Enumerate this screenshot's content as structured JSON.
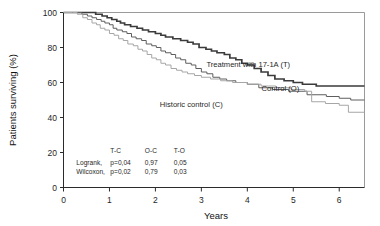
{
  "chart_data": {
    "type": "line",
    "title": "",
    "xlabel": "Years",
    "ylabel": "Patients surviving (%)",
    "xlim": [
      0,
      6.55
    ],
    "ylim": [
      0,
      100
    ],
    "xticks": [
      "0",
      "1",
      "2",
      "3",
      "4",
      "5",
      "6"
    ],
    "xtick_values": [
      0,
      1,
      2,
      3,
      4,
      5,
      6
    ],
    "yticks": [
      "0",
      "20",
      "40",
      "60",
      "80",
      "100"
    ],
    "ytick_values": [
      0,
      20,
      40,
      60,
      80,
      100
    ],
    "grid": false,
    "legend_position": "inline-annotations",
    "series": [
      {
        "name": "Treatment with 17-1A (T)",
        "key": "T",
        "color": "#3b3b3b",
        "label_x": 4.02,
        "label_y": 69,
        "points": [
          [
            0.0,
            100
          ],
          [
            0.62,
            100
          ],
          [
            0.7,
            99
          ],
          [
            0.84,
            98
          ],
          [
            0.95,
            97
          ],
          [
            1.05,
            96
          ],
          [
            1.16,
            95
          ],
          [
            1.24,
            94
          ],
          [
            1.33,
            93
          ],
          [
            1.46,
            92
          ],
          [
            1.6,
            91
          ],
          [
            1.72,
            90
          ],
          [
            1.85,
            89
          ],
          [
            2.0,
            88
          ],
          [
            2.12,
            87
          ],
          [
            2.22,
            86
          ],
          [
            2.38,
            85
          ],
          [
            2.55,
            84
          ],
          [
            2.7,
            83
          ],
          [
            2.82,
            82
          ],
          [
            2.95,
            80
          ],
          [
            3.1,
            79
          ],
          [
            3.22,
            78
          ],
          [
            3.34,
            77
          ],
          [
            3.5,
            76
          ],
          [
            3.62,
            74
          ],
          [
            3.75,
            73
          ],
          [
            3.88,
            71
          ],
          [
            4.0,
            70
          ],
          [
            4.15,
            68
          ],
          [
            4.3,
            66
          ],
          [
            4.45,
            64
          ],
          [
            4.6,
            62
          ],
          [
            4.8,
            61
          ],
          [
            5.0,
            60
          ],
          [
            5.2,
            59
          ],
          [
            5.5,
            58
          ],
          [
            6.0,
            58
          ],
          [
            6.55,
            58
          ]
        ]
      },
      {
        "name": "Control (O)",
        "key": "O",
        "color": "#5e5e5e",
        "label_x": 4.72,
        "label_y": 55,
        "points": [
          [
            0.0,
            100
          ],
          [
            0.3,
            100
          ],
          [
            0.4,
            99
          ],
          [
            0.52,
            98
          ],
          [
            0.62,
            97
          ],
          [
            0.72,
            96
          ],
          [
            0.82,
            95
          ],
          [
            0.9,
            94
          ],
          [
            1.0,
            93
          ],
          [
            1.08,
            91
          ],
          [
            1.16,
            90
          ],
          [
            1.28,
            89
          ],
          [
            1.38,
            88
          ],
          [
            1.48,
            86
          ],
          [
            1.58,
            85
          ],
          [
            1.7,
            84
          ],
          [
            1.8,
            82
          ],
          [
            1.92,
            81
          ],
          [
            2.02,
            80
          ],
          [
            2.12,
            78
          ],
          [
            2.22,
            77
          ],
          [
            2.34,
            76
          ],
          [
            2.44,
            74
          ],
          [
            2.55,
            73
          ],
          [
            2.66,
            71
          ],
          [
            2.78,
            70
          ],
          [
            2.88,
            68
          ],
          [
            3.0,
            66
          ],
          [
            3.12,
            65
          ],
          [
            3.25,
            63
          ],
          [
            3.4,
            62
          ],
          [
            3.55,
            61
          ],
          [
            3.75,
            60
          ],
          [
            4.0,
            59
          ],
          [
            4.25,
            57
          ],
          [
            4.55,
            56
          ],
          [
            4.9,
            55
          ],
          [
            5.3,
            53
          ],
          [
            5.72,
            52
          ],
          [
            6.0,
            51
          ],
          [
            6.25,
            50
          ],
          [
            6.55,
            50
          ]
        ]
      },
      {
        "name": "Historic control (C)",
        "key": "C",
        "color": "#a6a6a6",
        "label_x": 2.78,
        "label_y": 46,
        "points": [
          [
            0.0,
            100
          ],
          [
            0.2,
            100
          ],
          [
            0.3,
            99
          ],
          [
            0.42,
            97
          ],
          [
            0.52,
            96
          ],
          [
            0.62,
            94
          ],
          [
            0.72,
            93
          ],
          [
            0.8,
            91
          ],
          [
            0.9,
            90
          ],
          [
            1.0,
            88
          ],
          [
            1.1,
            87
          ],
          [
            1.2,
            85
          ],
          [
            1.3,
            84
          ],
          [
            1.4,
            82
          ],
          [
            1.52,
            81
          ],
          [
            1.62,
            79
          ],
          [
            1.72,
            78
          ],
          [
            1.82,
            76
          ],
          [
            1.92,
            74
          ],
          [
            2.02,
            73
          ],
          [
            2.12,
            71
          ],
          [
            2.22,
            70
          ],
          [
            2.34,
            68
          ],
          [
            2.46,
            67
          ],
          [
            2.58,
            66
          ],
          [
            2.7,
            65
          ],
          [
            2.85,
            64
          ],
          [
            3.0,
            63
          ],
          [
            3.2,
            62
          ],
          [
            3.42,
            61
          ],
          [
            3.68,
            60
          ],
          [
            4.0,
            59
          ],
          [
            4.3,
            58
          ],
          [
            4.62,
            57
          ],
          [
            4.95,
            56
          ],
          [
            5.25,
            55
          ],
          [
            5.4,
            49
          ],
          [
            5.7,
            48
          ],
          [
            6.0,
            47
          ],
          [
            6.2,
            43
          ],
          [
            6.55,
            43
          ]
        ]
      }
    ],
    "stats_table": {
      "columns": [
        "T-C",
        "O-C",
        "T-O"
      ],
      "rows": [
        {
          "label": "Logrank,",
          "values": [
            "p=0,04",
            "0,97",
            "0,05"
          ]
        },
        {
          "label": "Wilcoxon,",
          "values": [
            "p=0,02",
            "0,79",
            "0,03"
          ]
        }
      ]
    }
  }
}
